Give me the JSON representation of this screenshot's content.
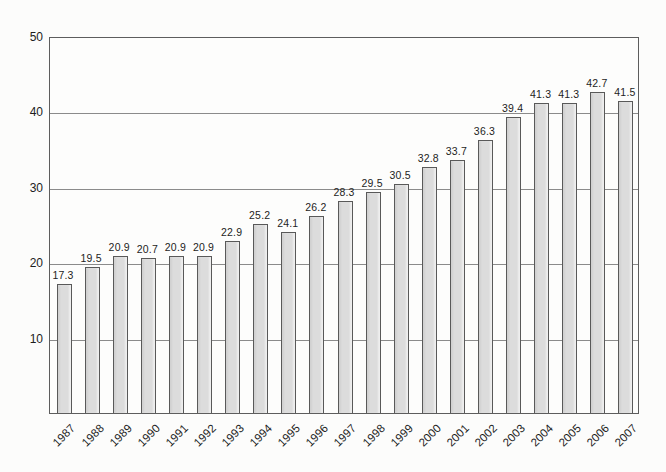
{
  "chart_data": {
    "type": "bar",
    "title": "",
    "xlabel": "",
    "ylabel": "",
    "categories": [
      "1987",
      "1988",
      "1989",
      "1990",
      "1991",
      "1992",
      "1993",
      "1994",
      "1995",
      "1996",
      "1997",
      "1998",
      "1999",
      "2000",
      "2001",
      "2002",
      "2003",
      "2004",
      "2005",
      "2006",
      "2007"
    ],
    "values": [
      17.3,
      19.5,
      20.9,
      20.7,
      20.9,
      20.9,
      22.9,
      25.2,
      24.1,
      26.2,
      28.3,
      29.5,
      30.5,
      32.8,
      33.7,
      36.3,
      39.4,
      41.3,
      41.3,
      42.7,
      41.5
    ],
    "data_labels": [
      "17.3",
      "19.5",
      "20.9",
      "20.7",
      "20.9",
      "20.9",
      "22.9",
      "25.2",
      "24.1",
      "26.2",
      "28.3",
      "29.5",
      "30.5",
      "32.8",
      "33.7",
      "36.3",
      "39.4",
      "41.3",
      "41.3",
      "42.7",
      "41.5"
    ],
    "ylim": [
      0,
      50
    ],
    "yticks": [
      10,
      20,
      30,
      40,
      50
    ],
    "grid": true,
    "legend": false,
    "colors": {
      "bar_fill": "#dcdcdc",
      "bar_border": "#595959",
      "gridline": "#8b8b8b",
      "plot_border": "#5d5d5d",
      "text": "#1d1d1d",
      "background": "#fcfcfb"
    }
  }
}
